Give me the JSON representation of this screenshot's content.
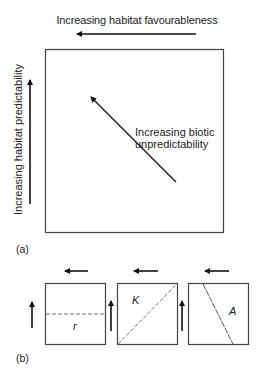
{
  "panel_a": {
    "label": "(a)",
    "x_axis_label": "Increasing habitat favourableness",
    "y_axis_label": "Increasing habitat predictability",
    "diagonal_label_line1": "Increasing biotic",
    "diagonal_label_line2": "unpredictability"
  },
  "panel_b": {
    "label": "(b)",
    "boxes": [
      {
        "letter": "r",
        "divider": "horizontal dashed line"
      },
      {
        "letter": "K",
        "divider": "diagonal dashed line bottom-left to top-right"
      },
      {
        "letter": "A",
        "divider": "diagonal dashed line top-left to bottom-right"
      }
    ]
  },
  "colors": {
    "line": "#333333",
    "dashed": "#777777"
  }
}
